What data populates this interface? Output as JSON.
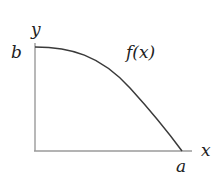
{
  "diagram": {
    "type": "function-plot",
    "labels": {
      "y_axis": "y",
      "x_axis": "x",
      "y_intercept": "b",
      "x_intercept": "a",
      "function": "f(x)"
    },
    "colors": {
      "axis": "#9a9a9a",
      "curve": "#3a3a3a",
      "text": "#222222"
    }
  }
}
